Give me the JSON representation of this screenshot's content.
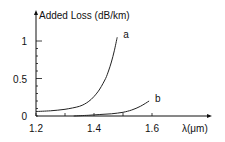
{
  "chart_data": {
    "type": "line",
    "title": "",
    "ylabel": "Added Loss (dB/km)",
    "xlabel": "λ(μm)",
    "xlim": [
      1.2,
      1.8
    ],
    "ylim": [
      0,
      1.2
    ],
    "x_ticks": [
      1.2,
      1.3,
      1.4,
      1.5,
      1.6
    ],
    "x_tick_labels": [
      {
        "value": 1.2,
        "label": "1.2"
      },
      {
        "value": 1.4,
        "label": "1.4"
      },
      {
        "value": 1.6,
        "label": "1.6"
      }
    ],
    "y_ticks": [
      0,
      0.1,
      0.2,
      0.3,
      0.4,
      0.5,
      0.6,
      0.7,
      0.8,
      0.9,
      1.0
    ],
    "y_tick_labels": [
      {
        "value": 0,
        "label": "0"
      },
      {
        "value": 0.5,
        "label": "0.5"
      },
      {
        "value": 1.0,
        "label": "1"
      }
    ],
    "grid": false,
    "series": [
      {
        "name": "a",
        "x": [
          1.2,
          1.25,
          1.3,
          1.35,
          1.38,
          1.4,
          1.42,
          1.44,
          1.45,
          1.46,
          1.47,
          1.48
        ],
        "values": [
          0.06,
          0.07,
          0.09,
          0.13,
          0.19,
          0.26,
          0.36,
          0.5,
          0.6,
          0.72,
          0.87,
          1.05
        ]
      },
      {
        "name": "b",
        "x": [
          1.33,
          1.38,
          1.42,
          1.46,
          1.5,
          1.53,
          1.56,
          1.59
        ],
        "values": [
          0.0,
          0.01,
          0.02,
          0.03,
          0.05,
          0.08,
          0.13,
          0.2
        ]
      }
    ]
  }
}
